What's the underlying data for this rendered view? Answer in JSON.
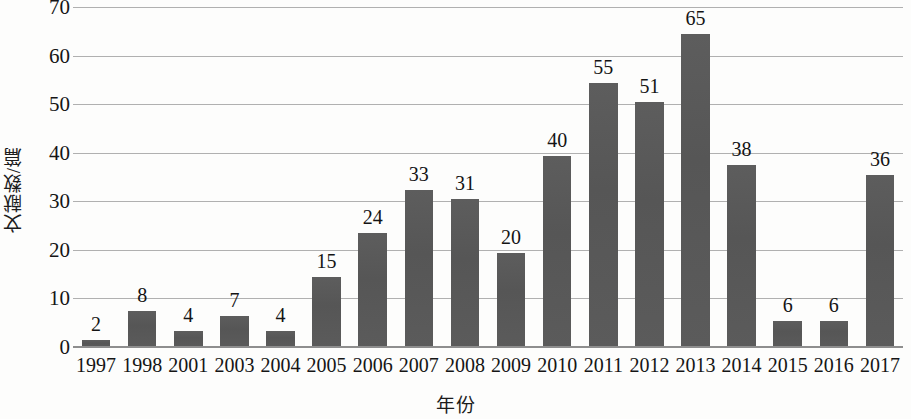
{
  "chart_data": {
    "type": "bar",
    "title": "",
    "xlabel": "年份",
    "ylabel": "文献数/篇",
    "categories": [
      "1997",
      "1998",
      "2001",
      "2003",
      "2004",
      "2005",
      "2006",
      "2007",
      "2008",
      "2009",
      "2010",
      "2011",
      "2012",
      "2013",
      "2014",
      "2015",
      "2016",
      "2017"
    ],
    "values": [
      2,
      8,
      4,
      7,
      4,
      15,
      24,
      33,
      31,
      20,
      40,
      55,
      51,
      65,
      38,
      6,
      6,
      36
    ],
    "data_labels": [
      "2",
      "8",
      "4",
      "7",
      "4",
      "15",
      "24",
      "33",
      "31",
      "20",
      "40",
      "55",
      "51",
      "65",
      "38",
      "6",
      "6",
      "36"
    ],
    "ylim": [
      0,
      70
    ],
    "yticks": [
      0,
      10,
      20,
      30,
      40,
      50,
      60,
      70
    ],
    "ytick_labels": [
      "0",
      "10",
      "20",
      "30",
      "40",
      "50",
      "60",
      "70"
    ],
    "grid": true,
    "legend": false,
    "legend_position": "none",
    "series": [
      {
        "name": "文献数",
        "values": [
          2,
          8,
          4,
          7,
          4,
          15,
          24,
          33,
          31,
          20,
          40,
          55,
          51,
          65,
          38,
          6,
          6,
          36
        ],
        "color": "#595959"
      }
    ],
    "colors": {
      "bar": "#595959",
      "gridline": "#b0b0b0",
      "axis": "#8e8e8e",
      "text": "#151515",
      "background": "#fdfdfc"
    }
  }
}
